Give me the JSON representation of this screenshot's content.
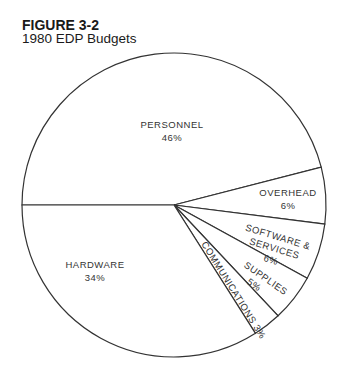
{
  "figure": {
    "number": "FIGURE 3-2",
    "title": "1980 EDP Budgets"
  },
  "colors": {
    "stroke": "#333333",
    "fill": "#ffffff",
    "text": "#333333"
  },
  "chart_data": {
    "type": "pie",
    "title": "1980 EDP Budgets",
    "categories": [
      "PERSONNEL",
      "OVERHEAD",
      "SOFTWARE & SERVICES",
      "SUPPLIES",
      "COMMUNICATIONS",
      "HARDWARE"
    ],
    "values": [
      46,
      6,
      6,
      5,
      3,
      34
    ],
    "units": "%",
    "start_angle_deg": 180,
    "direction": "clockwise",
    "labels": [
      {
        "name": "PERSONNEL",
        "pct": "46%"
      },
      {
        "name": "OVERHEAD",
        "pct": "6%"
      },
      {
        "name": "SOFTWARE &",
        "name2": "SERVICES",
        "pct": "6%"
      },
      {
        "name": "SUPPLIES",
        "pct": "5%"
      },
      {
        "name": "COMMUNICATIONS 3%"
      },
      {
        "name": "HARDWARE",
        "pct": "34%"
      }
    ]
  }
}
